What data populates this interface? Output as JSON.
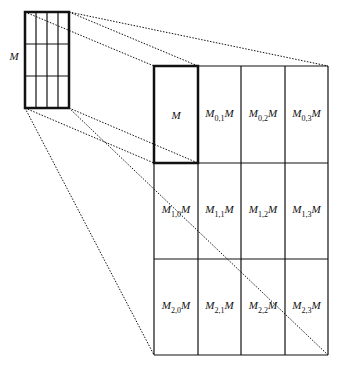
{
  "small_matrix": {
    "label": "M",
    "x": 25,
    "y": 12,
    "w": 44,
    "h": 96,
    "cols": 4,
    "rows": 3
  },
  "big_grid": {
    "x": 154,
    "y": 66,
    "col_edges": [
      154,
      198,
      241,
      285,
      328
    ],
    "row_edges": [
      66,
      163,
      259,
      355
    ],
    "cells": [
      [
        {
          "base": "M",
          "sub": "",
          "suffix": ""
        },
        {
          "base": "M",
          "sub": "0,1",
          "suffix": "M"
        },
        {
          "base": "M",
          "sub": "0,2",
          "suffix": "M"
        },
        {
          "base": "M",
          "sub": "0,3",
          "suffix": "M"
        }
      ],
      [
        {
          "base": "M",
          "sub": "1,0",
          "suffix": "M"
        },
        {
          "base": "M",
          "sub": "1,1",
          "suffix": "M"
        },
        {
          "base": "M",
          "sub": "1,2",
          "suffix": "M"
        },
        {
          "base": "M",
          "sub": "1,3",
          "suffix": "M"
        }
      ],
      [
        {
          "base": "M",
          "sub": "2,0",
          "suffix": "M"
        },
        {
          "base": "M",
          "sub": "2,1",
          "suffix": "M"
        },
        {
          "base": "M",
          "sub": "2,2",
          "suffix": "M"
        },
        {
          "base": "M",
          "sub": "2,3",
          "suffix": "M"
        }
      ]
    ]
  },
  "projection_lines": [
    [
      25,
      12,
      154,
      66
    ],
    [
      69,
      12,
      198,
      66
    ],
    [
      69,
      12,
      328,
      66
    ],
    [
      25,
      108,
      154,
      163
    ],
    [
      25,
      108,
      154,
      355
    ],
    [
      69,
      108,
      198,
      163
    ],
    [
      69,
      108,
      328,
      355
    ]
  ]
}
